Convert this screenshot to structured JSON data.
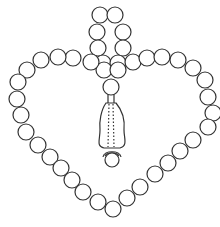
{
  "figure": {
    "stroke_color": "#333333",
    "background": "#ffffff",
    "bead_radius": 8,
    "beads": {
      "top_loop": [
        [
          100,
          15
        ],
        [
          115,
          15
        ],
        [
          97,
          32
        ],
        [
          123,
          32
        ],
        [
          98,
          48
        ],
        [
          123,
          48
        ]
      ],
      "center_cluster": [
        [
          103,
          63
        ],
        [
          118,
          63
        ],
        [
          104,
          70
        ],
        [
          118,
          70
        ],
        [
          111,
          87
        ]
      ],
      "left_arm": [
        [
          91,
          62
        ],
        [
          73,
          58
        ],
        [
          58,
          57
        ],
        [
          41,
          60
        ],
        [
          27,
          70
        ],
        [
          18,
          82
        ],
        [
          17,
          99
        ],
        [
          21,
          115
        ],
        [
          26,
          132
        ],
        [
          38,
          145
        ],
        [
          50,
          157
        ],
        [
          61,
          168
        ],
        [
          72,
          180
        ],
        [
          83,
          192
        ],
        [
          98,
          202
        ]
      ],
      "bottom": [
        [
          113,
          209
        ]
      ],
      "right_arm": [
        [
          133,
          62
        ],
        [
          147,
          58
        ],
        [
          162,
          57
        ],
        [
          178,
          60
        ],
        [
          193,
          68
        ],
        [
          205,
          80
        ],
        [
          208,
          97
        ],
        [
          213,
          113
        ],
        [
          208,
          127
        ],
        [
          193,
          140
        ],
        [
          180,
          151
        ],
        [
          168,
          163
        ],
        [
          155,
          174
        ],
        [
          140,
          187
        ],
        [
          127,
          198
        ]
      ]
    },
    "pendant": {
      "label": "tassel",
      "end_bead": [
        112,
        160
      ]
    }
  }
}
